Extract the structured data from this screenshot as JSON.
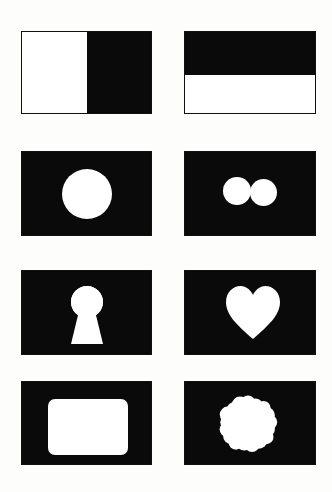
{
  "figure": {
    "background_color": "#fdfdfc",
    "panel_fill_color": "#0a0a0a",
    "shape_color": "#ffffff",
    "panel_border_color": "#111111",
    "columns": 2,
    "rows": 4,
    "panel_count": 8
  },
  "panels": [
    {
      "index": 1,
      "position": "row-1-left",
      "name": "vertical-bicolor-panel",
      "description": "Rectangle split vertically: white left portion, black right portion",
      "x": 21,
      "y": 31,
      "width": 131,
      "height": 83,
      "shape_type": "vertical-split",
      "white_fraction": 0.5
    },
    {
      "index": 2,
      "position": "row-1-right",
      "name": "horizontal-bicolor-panel",
      "description": "Rectangle split horizontally: black top band, white bottom band",
      "x": 184,
      "y": 31,
      "width": 132,
      "height": 83,
      "shape_type": "horizontal-split",
      "white_fraction": 0.47
    },
    {
      "index": 3,
      "position": "row-2-left",
      "name": "single-circle-panel",
      "description": "Black rectangle containing one large white circle",
      "x": 21,
      "y": 151,
      "width": 131,
      "height": 85,
      "shape_type": "circle",
      "circle": {
        "cx": 65,
        "cy": 42,
        "r": 25
      }
    },
    {
      "index": 4,
      "position": "row-2-right",
      "name": "double-circle-panel",
      "description": "Black rectangle containing two touching white circles",
      "x": 184,
      "y": 151,
      "width": 132,
      "height": 85,
      "shape_type": "two-circles",
      "circles": [
        {
          "cx": 52,
          "cy": 39,
          "r": 14
        },
        {
          "cx": 79,
          "cy": 40,
          "r": 13
        }
      ]
    },
    {
      "index": 5,
      "position": "row-3-left",
      "name": "keyhole-panel",
      "description": "Black rectangle containing a white keyhole silhouette",
      "x": 21,
      "y": 270,
      "width": 131,
      "height": 85,
      "shape_type": "keyhole",
      "keyhole": {
        "head_cx": 65,
        "head_cy": 31,
        "head_r": 16,
        "stem_top_w": 15,
        "stem_bottom_w": 32,
        "stem_bottom_y": 73
      }
    },
    {
      "index": 6,
      "position": "row-3-right",
      "name": "heart-panel",
      "description": "Black rectangle containing a white heart silhouette",
      "x": 184,
      "y": 270,
      "width": 132,
      "height": 85,
      "shape_type": "heart",
      "heart": {
        "cx": 68,
        "top_y": 15,
        "width": 54,
        "height": 53
      }
    },
    {
      "index": 7,
      "position": "row-4-left",
      "name": "rounded-rectangle-panel",
      "description": "Black rectangle containing a white rounded rectangle aperture",
      "x": 21,
      "y": 381,
      "width": 131,
      "height": 84,
      "shape_type": "rounded-rectangle",
      "inner_rect": {
        "x": 26,
        "y": 17,
        "width": 80,
        "height": 56,
        "radius": 7
      }
    },
    {
      "index": 8,
      "position": "row-4-right",
      "name": "scalloped-blob-panel",
      "description": "Black rectangle containing a white scalloped blob with rounded lobes",
      "x": 184,
      "y": 381,
      "width": 132,
      "height": 84,
      "shape_type": "scalloped-blob",
      "blob": {
        "cx": 63,
        "cy": 42,
        "mean_radius": 28,
        "lobe_count": 17
      }
    }
  ]
}
